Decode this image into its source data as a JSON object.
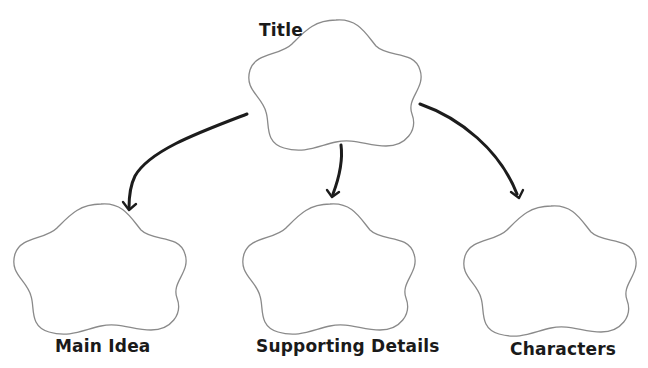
{
  "diagram": {
    "type": "graphic-organizer",
    "root": {
      "label": "Title",
      "shape": "flower-cloud"
    },
    "children": [
      {
        "label": "Main Idea",
        "shape": "flower-cloud"
      },
      {
        "label": "Supporting Details",
        "shape": "flower-cloud"
      },
      {
        "label": "Characters",
        "shape": "flower-cloud"
      }
    ],
    "edges": [
      {
        "from": "Title",
        "to": "Main Idea"
      },
      {
        "from": "Title",
        "to": "Supporting Details"
      },
      {
        "from": "Title",
        "to": "Characters"
      }
    ],
    "colors": {
      "background": "#ffffff",
      "shape_outline": "#8a8a8a",
      "arrow": "#1c1c1c",
      "text": "#1a1a1a"
    }
  }
}
